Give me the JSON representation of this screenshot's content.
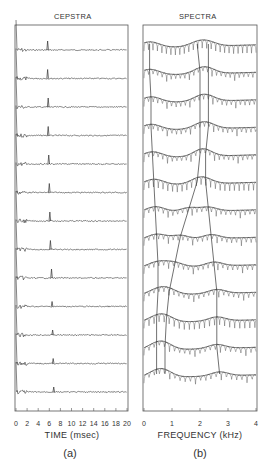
{
  "figure": {
    "panels": [
      {
        "id": "a",
        "title": "CEPSTRA",
        "xlabel": "TIME (msec)",
        "sublabel": "(a)",
        "tick_labels": [
          "0",
          "2",
          "4",
          "6",
          "8",
          "10",
          "12",
          "14",
          "16",
          "18",
          "20"
        ],
        "xlim": [
          0,
          20
        ],
        "n_traces": 13
      },
      {
        "id": "b",
        "title": "SPECTRA",
        "xlabel": "FREQUENCY (kHz)",
        "sublabel": "(b)",
        "tick_labels": [
          "0",
          "1",
          "2",
          "3",
          "4"
        ],
        "xlim": [
          0,
          4
        ],
        "n_traces": 13
      }
    ]
  },
  "chart_data": [
    {
      "type": "line",
      "title": "CEPSTRA",
      "xlabel": "TIME (msec)",
      "ylabel": "",
      "xlim": [
        0,
        20
      ],
      "x_ticks": [
        0,
        2,
        4,
        6,
        8,
        10,
        12,
        14,
        16,
        18,
        20
      ],
      "grid": false,
      "description": "13 vertically stacked cepstrum traces (successive speech frames), each with a sharp pitch peak",
      "pitch_peak_ms": [
        5.7,
        5.7,
        5.8,
        5.8,
        5.9,
        6.0,
        6.1,
        6.2,
        6.4,
        6.5,
        6.6,
        6.7,
        6.8
      ]
    },
    {
      "type": "line",
      "title": "SPECTRA",
      "xlabel": "FREQUENCY (kHz)",
      "ylabel": "",
      "xlim": [
        0,
        4
      ],
      "x_ticks": [
        0,
        1,
        2,
        3,
        4
      ],
      "grid": false,
      "description": "13 vertically stacked log-magnitude spectra with harmonic structure and smoothed envelopes; lines connect formant peaks across frames",
      "formant_tracks_khz": {
        "F1": [
          0.2,
          0.2,
          0.25,
          0.25,
          0.3,
          0.35,
          0.4,
          0.45,
          0.5,
          0.5,
          0.45,
          0.45,
          0.45
        ],
        "F2": [
          1.9,
          2.0,
          2.0,
          2.0,
          2.0,
          1.9,
          1.6,
          1.3,
          1.1,
          0.9,
          0.8,
          0.75,
          0.75
        ],
        "F3": [
          2.3,
          2.3,
          2.3,
          2.3,
          2.2,
          2.2,
          2.3,
          2.4,
          2.5,
          2.6,
          2.6,
          2.6,
          2.7
        ]
      }
    }
  ]
}
